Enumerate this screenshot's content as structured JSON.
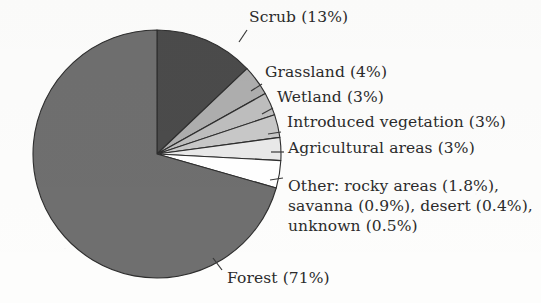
{
  "figure": {
    "kind": "pie-chart",
    "background_color": "#fdfdfc",
    "text_color": "#2b2b2b",
    "leader_line_color": "#3a3a3a",
    "outline_color": "#2e2e2e"
  },
  "chart_data": {
    "type": "pie",
    "title": "",
    "xlabel": "",
    "ylabel": "",
    "legend_position": "callout-labels-right",
    "grid": false,
    "start_angle_deg": 0,
    "direction": "clockwise",
    "center": {
      "x": 157,
      "y": 154
    },
    "radius": 124,
    "categories": [
      "Scrub",
      "Grassland",
      "Wetland",
      "Introduced vegetation",
      "Agricultural areas",
      "Other",
      "Forest"
    ],
    "values": [
      13,
      4,
      3,
      3,
      3,
      3.6,
      71
    ],
    "colors": [
      "#4b4b4b",
      "#aeaeae",
      "#bebebe",
      "#c8c8c8",
      "#e9e9e9",
      "#ffffff",
      "#6f6f6f"
    ],
    "slices": [
      {
        "name": "Scrub",
        "value": 13,
        "color": "#4b4b4b",
        "label": "Scrub (13%)"
      },
      {
        "name": "Grassland",
        "value": 4,
        "color": "#aeaeae",
        "label": "Grassland (4%)"
      },
      {
        "name": "Wetland",
        "value": 3,
        "color": "#bebebe",
        "label": "Wetland (3%)"
      },
      {
        "name": "Introduced vegetation",
        "value": 3,
        "color": "#c8c8c8",
        "label": "Introduced vegetation (3%)"
      },
      {
        "name": "Agricultural areas",
        "value": 3,
        "color": "#e9e9e9",
        "label": "Agricultural areas (3%)"
      },
      {
        "name": "Other",
        "value": 3.6,
        "color": "#ffffff",
        "label": "Other: rocky areas (1.8%), savanna (0.9%), desert (0.4%), unknown (0.5%)"
      },
      {
        "name": "Forest",
        "value": 71,
        "color": "#6f6f6f",
        "label": "Forest (71%)"
      }
    ],
    "other_breakdown": [
      {
        "name": "rocky areas",
        "value": 1.8
      },
      {
        "name": "savanna",
        "value": 0.9
      },
      {
        "name": "desert",
        "value": 0.4
      },
      {
        "name": "unknown",
        "value": 0.5
      }
    ],
    "annotations": [
      "Scrub (13%)",
      "Grassland (4%)",
      "Wetland (3%)",
      "Introduced vegetation (3%)",
      "Agricultural areas (3%)",
      "Other: rocky areas (1.8%),",
      "savanna (0.9%), desert (0.4%),",
      "unknown (0.5%)",
      "Forest (71%)"
    ]
  },
  "labels": {
    "scrub": "Scrub (13%)",
    "grassland": "Grassland (4%)",
    "wetland": "Wetland (3%)",
    "introduced_vegetation": "Introduced vegetation (3%)",
    "agricultural_areas": "Agricultural areas (3%)",
    "other_line1": "Other: rocky areas (1.8%),",
    "other_line2": "savanna (0.9%), desert (0.4%),",
    "other_line3": "unknown (0.5%)",
    "forest": "Forest (71%)"
  }
}
